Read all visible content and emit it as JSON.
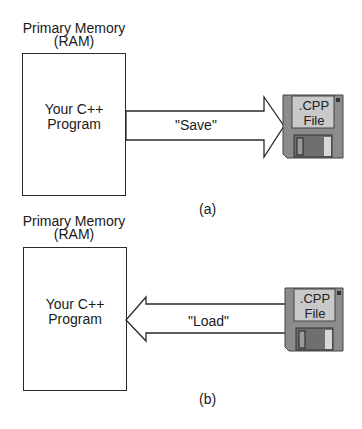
{
  "panels": [
    {
      "id": "a",
      "memory_title_line1": "Primary Memory",
      "memory_title_line2": "(RAM)",
      "program_line1": "Your C++",
      "program_line2": "Program",
      "arrow_label": "\"Save\"",
      "arrow_direction": "right",
      "disk_line1": ".CPP",
      "disk_line2": "File",
      "caption": "(a)"
    },
    {
      "id": "b",
      "memory_title_line1": "Primary Memory",
      "memory_title_line2": "(RAM)",
      "program_line1": "Your C++",
      "program_line2": "Program",
      "arrow_label": "\"Load\"",
      "arrow_direction": "left",
      "disk_line1": ".CPP",
      "disk_line2": "File",
      "caption": "(b)"
    }
  ],
  "colors": {
    "disk_body": "#8c8c8c",
    "disk_label": "#c9c9c9",
    "disk_shutter": "#6f6f6f",
    "outline": "#2a2a2a"
  }
}
